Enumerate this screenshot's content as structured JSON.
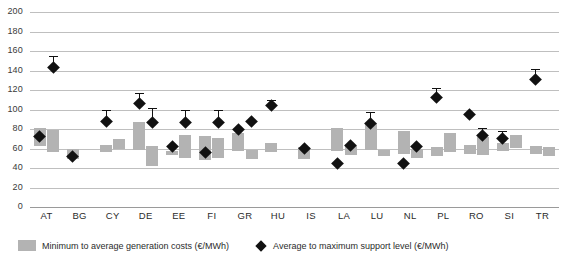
{
  "chart_data": {
    "type": "bar",
    "title": "",
    "xlabel": "",
    "ylabel": "",
    "ylim": [
      0,
      200
    ],
    "ytick_step": 20,
    "yticks": [
      200,
      180,
      160,
      140,
      120,
      100,
      80,
      60,
      40,
      20,
      0
    ],
    "grid": true,
    "legend_position": "bottom-left",
    "categories": [
      "AT",
      "BG",
      "CY",
      "DE",
      "EE",
      "FI",
      "GR",
      "HU",
      "IS",
      "LA",
      "LU",
      "NL",
      "PL",
      "RO",
      "SI",
      "TR"
    ],
    "series": [
      {
        "name": "Minimum to average generation costs (€/MWh)",
        "type": "range-bar",
        "color": "#b3b3b3",
        "unit": "€/MWh",
        "groups": [
          {
            "category": "AT",
            "bars": [
              {
                "min": 63,
                "max": 81
              },
              {
                "min": 56,
                "max": 79
              }
            ]
          },
          {
            "category": "BG",
            "bars": [
              {
                "min": 49,
                "max": 59
              },
              null
            ]
          },
          {
            "category": "CY",
            "bars": [
              {
                "min": 56,
                "max": 64
              },
              {
                "min": 60,
                "max": 70
              }
            ]
          },
          {
            "category": "DE",
            "bars": [
              {
                "min": 58,
                "max": 87
              },
              {
                "min": 42,
                "max": 63
              }
            ]
          },
          {
            "category": "EE",
            "bars": [
              {
                "min": 53,
                "max": 57
              },
              {
                "min": 50,
                "max": 74
              }
            ]
          },
          {
            "category": "FI",
            "bars": [
              {
                "min": 48,
                "max": 73
              },
              {
                "min": 50,
                "max": 71
              }
            ]
          },
          {
            "category": "GR",
            "bars": [
              {
                "min": 57,
                "max": 76
              },
              {
                "min": 49,
                "max": 58
              }
            ]
          },
          {
            "category": "HU",
            "bars": [
              {
                "min": 56,
                "max": 66
              },
              null
            ]
          },
          {
            "category": "IS",
            "bars": [
              {
                "min": 49,
                "max": 62
              },
              null
            ]
          },
          {
            "category": "LA",
            "bars": [
              {
                "min": 57,
                "max": 81
              },
              {
                "min": 53,
                "max": 63
              }
            ]
          },
          {
            "category": "LU",
            "bars": [
              {
                "min": 58,
                "max": 86
              },
              {
                "min": 52,
                "max": 58
              }
            ]
          },
          {
            "category": "NL",
            "bars": [
              {
                "min": 54,
                "max": 78
              },
              {
                "min": 50,
                "max": 60
              }
            ]
          },
          {
            "category": "PL",
            "bars": [
              {
                "min": 52,
                "max": 62
              },
              {
                "min": 56,
                "max": 76
              }
            ]
          },
          {
            "category": "RO",
            "bars": [
              {
                "min": 54,
                "max": 64
              },
              {
                "min": 53,
                "max": 72
              }
            ]
          },
          {
            "category": "SI",
            "bars": [
              {
                "min": 57,
                "max": 66
              },
              {
                "min": 60,
                "max": 74
              }
            ]
          },
          {
            "category": "TR",
            "bars": [
              {
                "min": 54,
                "max": 63
              },
              {
                "min": 52,
                "max": 62
              }
            ]
          }
        ]
      },
      {
        "name": "Average to maximum support level (€/MWh)",
        "type": "point-with-whisker",
        "color": "#111111",
        "unit": "€/MWh",
        "groups": [
          {
            "category": "AT",
            "points": [
              {
                "avg": 72,
                "max": 72
              },
              {
                "avg": 143,
                "max": 155
              }
            ]
          },
          {
            "category": "BG",
            "points": [
              {
                "avg": 52,
                "max": 52
              },
              null
            ]
          },
          {
            "category": "CY",
            "points": [
              {
                "avg": 88,
                "max": 99
              },
              null
            ]
          },
          {
            "category": "DE",
            "points": [
              {
                "avg": 106,
                "max": 117
              },
              {
                "avg": 87,
                "max": 102
              }
            ]
          },
          {
            "category": "EE",
            "points": [
              {
                "avg": 62,
                "max": 62
              },
              {
                "avg": 87,
                "max": 99
              }
            ]
          },
          {
            "category": "FI",
            "points": [
              {
                "avg": 56,
                "max": 56
              },
              {
                "avg": 87,
                "max": 99
              }
            ]
          },
          {
            "category": "GR",
            "points": [
              {
                "avg": 80,
                "max": 80
              },
              {
                "avg": 88,
                "max": 88
              }
            ]
          },
          {
            "category": "HU",
            "points": [
              {
                "avg": 104,
                "max": 110
              },
              null
            ]
          },
          {
            "category": "IS",
            "points": [
              {
                "avg": 60,
                "max": 60
              },
              null
            ]
          },
          {
            "category": "LA",
            "points": [
              {
                "avg": 45,
                "max": 45
              },
              {
                "avg": 63,
                "max": 63
              }
            ]
          },
          {
            "category": "LU",
            "points": [
              {
                "avg": 86,
                "max": 97
              },
              null
            ]
          },
          {
            "category": "NL",
            "points": [
              {
                "avg": 45,
                "max": 45
              },
              {
                "avg": 62,
                "max": 62
              }
            ]
          },
          {
            "category": "PL",
            "points": [
              {
                "avg": 112,
                "max": 122
              },
              null
            ]
          },
          {
            "category": "RO",
            "points": [
              {
                "avg": 95,
                "max": 95
              },
              {
                "avg": 73,
                "max": 81
              }
            ]
          },
          {
            "category": "SI",
            "points": [
              {
                "avg": 70,
                "max": 78
              },
              null
            ]
          },
          {
            "category": "TR",
            "points": [
              {
                "avg": 131,
                "max": 142
              },
              null
            ]
          }
        ]
      }
    ]
  },
  "legend": {
    "items": [
      {
        "label": "Minimum to average generation costs (€/MWh)",
        "marker": "gray-bar-swatch"
      },
      {
        "label": "Average to maximum support level (€/MWh)",
        "marker": "black-diamond-marker"
      }
    ]
  },
  "colors": {
    "bar": "#b3b3b3",
    "marker": "#111111",
    "gridline": "#bfbfbf",
    "background": "#ffffff"
  }
}
